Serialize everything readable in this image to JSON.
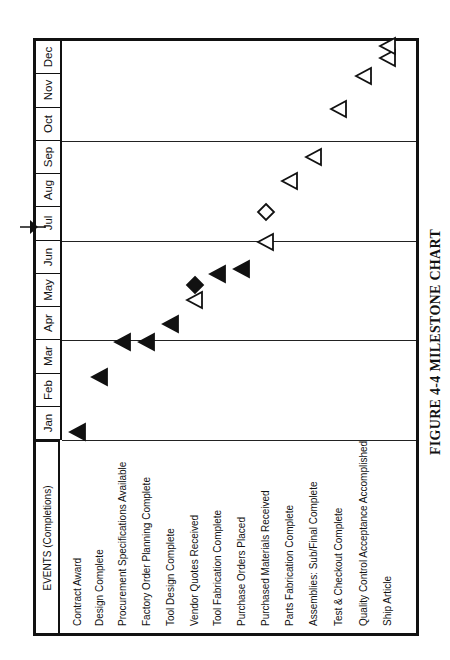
{
  "chart_data": {
    "type": "milestone",
    "title": "FIGURE 4-4 MILESTONE CHART",
    "orientation": "rotated 90 degrees counter-clockwise",
    "header": "EVENTS (Completions)",
    "months": [
      "Jan",
      "Feb",
      "Mar",
      "Apr",
      "May",
      "Jun",
      "Jul",
      "Aug",
      "Sep",
      "Oct",
      "Nov",
      "Dec"
    ],
    "quarter_lines_after": [
      "Mar",
      "Jun",
      "Sep"
    ],
    "status_date_marker": "end of Jun",
    "legend_inferred": {
      "filled_triangle": "completed milestone",
      "hollow_triangle": "scheduled milestone",
      "filled_diamond": "completed (slipped/rescheduled)",
      "hollow_diamond": "rescheduled milestone"
    },
    "events": [
      {
        "name": "Contract Award",
        "markers": [
          {
            "month": "Jan",
            "pos": 0.25,
            "shape": "filled-triangle"
          }
        ]
      },
      {
        "name": "Design Complete",
        "markers": [
          {
            "month": "Feb",
            "pos": 1.9,
            "shape": "filled-triangle"
          }
        ]
      },
      {
        "name": "Procurement Specifications Available",
        "markers": [
          {
            "month": "Mar",
            "pos": 2.95,
            "shape": "filled-triangle"
          }
        ]
      },
      {
        "name": "Factory Order Planning Complete",
        "markers": [
          {
            "month": "Mar",
            "pos": 2.95,
            "shape": "filled-triangle"
          }
        ]
      },
      {
        "name": "Tool Design Complete",
        "markers": [
          {
            "month": "Apr",
            "pos": 3.5,
            "shape": "filled-triangle"
          }
        ]
      },
      {
        "name": "Vendor Quotes Received",
        "markers": [
          {
            "month": "May",
            "pos": 4.2,
            "shape": "hollow-triangle"
          },
          {
            "month": "May",
            "pos": 4.65,
            "shape": "filled-diamond"
          }
        ]
      },
      {
        "name": "Tool Fabrication Complete",
        "markers": [
          {
            "month": "May",
            "pos": 5.0,
            "shape": "filled-triangle"
          }
        ]
      },
      {
        "name": "Purchase Orders Placed",
        "markers": [
          {
            "month": "Jun",
            "pos": 5.15,
            "shape": "filled-triangle"
          }
        ]
      },
      {
        "name": "Purchased Materials Received",
        "markers": [
          {
            "month": "Jun",
            "pos": 5.95,
            "shape": "hollow-triangle"
          },
          {
            "month": "Jul",
            "pos": 6.85,
            "shape": "hollow-diamond"
          }
        ]
      },
      {
        "name": "Parts Fabrication Complete",
        "markers": [
          {
            "month": "Aug",
            "pos": 7.8,
            "shape": "hollow-triangle"
          }
        ]
      },
      {
        "name": "Assemblies: Sub/Final Complete",
        "markers": [
          {
            "month": "Sep",
            "pos": 8.5,
            "shape": "hollow-triangle"
          }
        ]
      },
      {
        "name": "Test & Checkout Complete",
        "markers": [
          {
            "month": "Oct",
            "pos": 9.95,
            "shape": "hollow-triangle"
          }
        ]
      },
      {
        "name": "Quality Control Acceptance Accomplished",
        "markers": [
          {
            "month": "Nov",
            "pos": 10.95,
            "shape": "hollow-triangle"
          }
        ]
      },
      {
        "name": "Ship Article",
        "markers": [
          {
            "month": "Dec",
            "pos": 11.5,
            "shape": "hollow-triangle"
          },
          {
            "month": "Dec",
            "pos": 11.85,
            "shape": "hollow-triangle"
          }
        ]
      }
    ]
  },
  "labels": {
    "header": "EVENTS (Completions)",
    "caption": "FIGURE 4-4 MILESTONE CHART"
  }
}
